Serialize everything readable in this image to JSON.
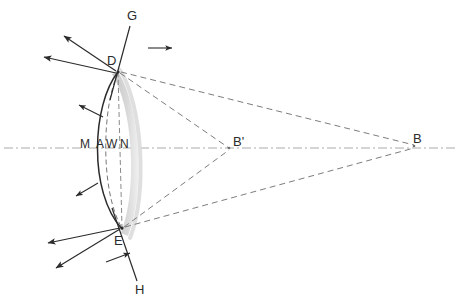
{
  "figure": {
    "background_color": "#ffffff",
    "width": 462,
    "height": 304
  },
  "colors": {
    "stroke_dark": "#2b2b2b",
    "stroke_mid": "#555555",
    "dashed_gray": "#8a8a8a",
    "axis_gray": "#aaaaaa",
    "band_gray": "#cfcfcf",
    "band_gray_light": "#e2e2e2",
    "label_color": "#2b2b2b"
  },
  "labels": {
    "g": "G",
    "d": "D",
    "m": "M",
    "a": "A",
    "w": "W",
    "n": "N",
    "b_prime": "B'",
    "b": "B",
    "e": "E",
    "h": "H"
  },
  "points": {
    "D": {
      "x": 118,
      "y": 72,
      "label": "D"
    },
    "E": {
      "x": 122,
      "y": 228,
      "label": "E"
    },
    "M": {
      "x": 88,
      "y": 148,
      "label": "M"
    },
    "A": {
      "x": 104,
      "y": 148,
      "label": "A"
    },
    "W": {
      "x": 115,
      "y": 148,
      "label": "W"
    },
    "N": {
      "x": 128,
      "y": 148,
      "label": "N"
    },
    "B_prime": {
      "x": 229,
      "y": 148,
      "label": "B'"
    },
    "B": {
      "x": 414,
      "y": 143,
      "label": "B"
    },
    "G": {
      "x": 131,
      "y": 18,
      "label": "G"
    },
    "H": {
      "x": 141,
      "y": 290,
      "label": "H"
    }
  },
  "axis": {
    "name": "optical-axis",
    "style": "dash-dot",
    "y": 148,
    "x_start": 4,
    "x_end": 458,
    "color": "#aaaaaa"
  },
  "arcs": {
    "outer_solid": {
      "name": "reflector-front-arc",
      "style": "solid",
      "color": "#2b2b2b"
    },
    "inner_dashed": {
      "name": "reflector-inner-arc",
      "style": "dashed",
      "color": "#777777"
    },
    "shaded_band": {
      "name": "reflector-body-band",
      "style": "filled",
      "color": "#cfcfcf"
    },
    "chord_dashed": {
      "name": "reflector-chord",
      "style": "dashed",
      "color": "#888888"
    }
  },
  "rays": {
    "dashed_to_b_prime": [
      {
        "name": "ray-D-to-Bprime",
        "from": "D",
        "to": "B'"
      },
      {
        "name": "ray-E-to-Bprime",
        "from": "E",
        "to": "B'"
      }
    ],
    "dashed_to_b": [
      {
        "name": "ray-D-to-B",
        "from": "D",
        "to": "B"
      },
      {
        "name": "ray-E-to-B",
        "from": "E",
        "to": "B"
      }
    ],
    "solid_arrows_from_D": [
      {
        "name": "arrow-D-upper-left",
        "angle_deg": 208
      },
      {
        "name": "arrow-D-left",
        "angle_deg": 193
      }
    ],
    "solid_arrows_from_E": [
      {
        "name": "arrow-E-left",
        "angle_deg": 160
      },
      {
        "name": "arrow-E-lower-left",
        "angle_deg": 145
      }
    ],
    "normal_lines": [
      {
        "name": "line-G-through-D",
        "label": "G"
      },
      {
        "name": "line-H-through-E",
        "label": "H"
      }
    ],
    "tick_arrows": [
      {
        "name": "tick-arrow-upper-curve"
      },
      {
        "name": "tick-arrow-lower-curve"
      },
      {
        "name": "tick-arrow-G-line"
      },
      {
        "name": "tick-arrow-H-line"
      }
    ]
  }
}
